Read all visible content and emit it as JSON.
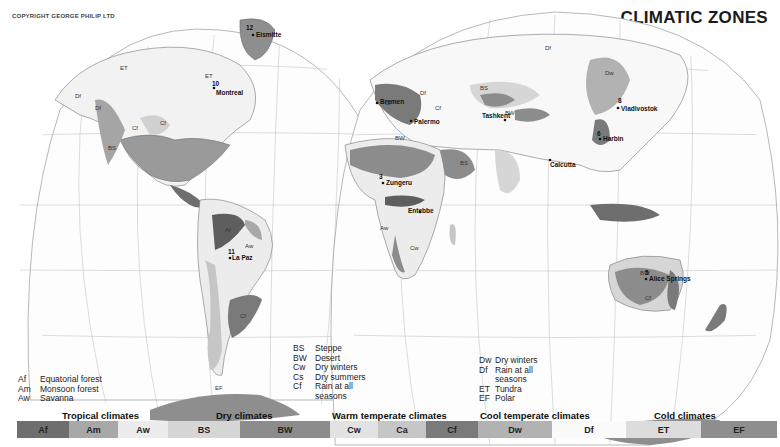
{
  "header": {
    "copyright": "COPYRIGHT GEORGE PHILIP LTD",
    "title": "CLIMATIC ZONES"
  },
  "map": {
    "cities": [
      {
        "name": "Eismitte",
        "number": "12"
      },
      {
        "name": "Montreal",
        "number": "10"
      },
      {
        "name": "Bremen",
        "number": ""
      },
      {
        "name": "Tashkent",
        "number": ""
      },
      {
        "name": "Palermo",
        "number": ""
      },
      {
        "name": "Vladivostok",
        "number": "8"
      },
      {
        "name": "Harbin",
        "number": "6"
      },
      {
        "name": "Zungeru",
        "number": "3"
      },
      {
        "name": "Entebbe",
        "number": ""
      },
      {
        "name": "Calcutta",
        "number": ""
      },
      {
        "name": "La Paz",
        "number": "11"
      },
      {
        "name": "Alice Springs",
        "number": "5"
      }
    ],
    "zone_labels": [
      "Af",
      "Am",
      "Aw",
      "BS",
      "BW",
      "Cw",
      "Cs",
      "Cf",
      "Dw",
      "Df",
      "ET",
      "EF"
    ]
  },
  "key": {
    "tropical": [
      {
        "code": "Af",
        "desc": "Equatorial forest"
      },
      {
        "code": "Am",
        "desc": "Monsoon forest"
      },
      {
        "code": "Aw",
        "desc": "Savanna"
      }
    ],
    "dry_warm": [
      {
        "code": "BS",
        "desc": "Steppe"
      },
      {
        "code": "BW",
        "desc": "Desert"
      },
      {
        "code": "Cw",
        "desc": "Dry winters"
      },
      {
        "code": "Cs",
        "desc": "Dry summers"
      },
      {
        "code": "Cf",
        "desc": "Rain at all"
      },
      {
        "code": "",
        "desc": "seasons"
      }
    ],
    "cool_cold": [
      {
        "code": "Dw",
        "desc": "Dry winters"
      },
      {
        "code": "Df",
        "desc": "Rain at all"
      },
      {
        "code": "",
        "desc": "seasons"
      },
      {
        "code": "ET",
        "desc": "Tundra"
      },
      {
        "code": "EF",
        "desc": "Polar"
      }
    ]
  },
  "legend": {
    "groups": [
      {
        "title": "Tropical climates"
      },
      {
        "title": "Dry climates"
      },
      {
        "title": "Warm temperate climates"
      },
      {
        "title": "Cool temperate climates"
      },
      {
        "title": "Cold climates"
      }
    ],
    "segments": [
      {
        "code": "Af",
        "color": "#6e6e6e",
        "width": 52
      },
      {
        "code": "Am",
        "color": "#a8a8a8",
        "width": 49
      },
      {
        "code": "Aw",
        "color": "#ececec",
        "width": 50
      },
      {
        "code": "BS",
        "color": "#d6d6d6",
        "width": 72
      },
      {
        "code": "BW",
        "color": "#8c8c8c",
        "width": 90
      },
      {
        "code": "Cw",
        "color": "#e2e2e2",
        "width": 48
      },
      {
        "code": "Ca",
        "color": "#c6c6c6",
        "width": 48
      },
      {
        "code": "Cf",
        "color": "#7a7a7a",
        "width": 52
      },
      {
        "code": "Dw",
        "color": "#b2b2b2",
        "width": 74
      },
      {
        "code": "Df",
        "color": "#fafafa",
        "width": 74
      },
      {
        "code": "ET",
        "color": "#dcdcdc",
        "width": 75
      },
      {
        "code": "EF",
        "color": "#8e8e8e",
        "width": 76
      }
    ]
  }
}
